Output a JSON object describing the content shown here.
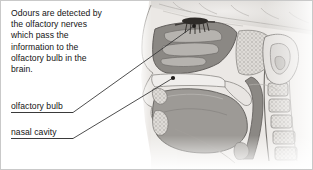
{
  "figure": {
    "background_color": "#ffffff",
    "border_color": "#c9c9c9",
    "text_color": "#141414",
    "leader_line_color": "#3a3a3a"
  },
  "caption": {
    "full_text": "Odours are detected by the olfactory nerves which pass the information to the olfactory bulb in the brain.",
    "lines": [
      "Odours are detected by",
      "the olfactory nerves",
      "which pass the",
      "information to the",
      "olfactory bulb in the",
      "brain."
    ]
  },
  "callouts": [
    {
      "id": "olfactory-bulb",
      "label": "olfactory bulb",
      "underline": true,
      "leader": {
        "from_x": 72,
        "from_y": 112,
        "to_x": 193,
        "to_y": 25
      },
      "marker": {
        "x": 193,
        "y": 25,
        "shape": "dot"
      }
    },
    {
      "id": "nasal-cavity",
      "label": "nasal cavity",
      "underline": true,
      "leader": {
        "from_x": 72,
        "from_y": 138,
        "to_x": 172,
        "to_y": 77
      },
      "marker": {
        "x": 172,
        "y": 77,
        "shape": "dot"
      }
    }
  ],
  "illustration": {
    "type": "grayscale-anatomical-sagittal-section",
    "description": "Mid-sagittal section through the human head and neck shown in grayscale, profile facing left.",
    "structures": [
      "olfactory bulb",
      "olfactory nerve filaments",
      "cribriform plate",
      "nasal cavity",
      "nasal conchae (turbinates)",
      "hard palate",
      "soft palate",
      "tongue",
      "oral cavity",
      "pharynx",
      "epiglottis",
      "larynx",
      "external ear (auricle)",
      "brain (frontal lobe)",
      "cervical vertebrae",
      "spinal canal",
      "mandible",
      "lips"
    ],
    "palette": {
      "skin_light": "#e6e3e0",
      "bone_light": "#d9d6d2",
      "tissue_mid": "#b5b2ae",
      "tissue_dark": "#8d8a86",
      "cavity_dark": "#6f6c68",
      "outline": "#5a5754",
      "highlight": "#f2f0ee"
    }
  }
}
